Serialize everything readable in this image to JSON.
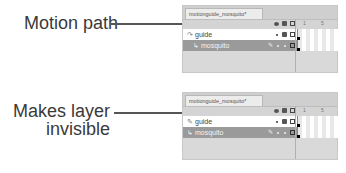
{
  "callouts": {
    "top": "Motion path",
    "bottom_line1": "Makes layer",
    "bottom_line2": "invisible"
  },
  "panels": [
    {
      "tab_label": "motionguide_mosquito*",
      "frame_numbers": [
        "1",
        "5"
      ],
      "layers": [
        {
          "name": "guide",
          "icon": "motion-guide-icon",
          "selected": false
        },
        {
          "name": "mosquito",
          "icon": "guided-layer-icon",
          "selected": true
        }
      ]
    },
    {
      "tab_label": "motionguide_mosquito*",
      "frame_numbers": [
        "1",
        "5"
      ],
      "layers": [
        {
          "name": "guide",
          "icon": "guide-layer-icon",
          "selected": false
        },
        {
          "name": "mosquito",
          "icon": "normal-layer-icon",
          "selected": true
        }
      ]
    }
  ],
  "icons": {
    "motion_guide": "↷",
    "guide_layer": "✎",
    "layer": "↳",
    "pencil": "✎"
  }
}
